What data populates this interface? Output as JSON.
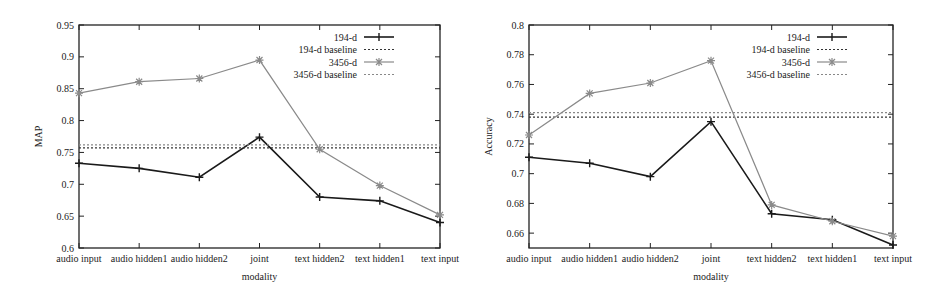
{
  "chart_data": [
    {
      "type": "line",
      "title": "",
      "xlabel": "modality",
      "ylabel": "MAP",
      "categories": [
        "audio input",
        "audio hidden1",
        "audio hidden2",
        "joint",
        "text hidden2",
        "text hidden1",
        "text input"
      ],
      "ylim": [
        0.6,
        0.95
      ],
      "yticks": [
        "0.6",
        "0.65",
        "0.7",
        "0.75",
        "0.8",
        "0.85",
        "0.9",
        "0.95"
      ],
      "grid": false,
      "legend_position": "top-right",
      "series": [
        {
          "name": "194-d",
          "style": "solid-plus",
          "color": "#1a1a1a",
          "values": [
            0.733,
            0.725,
            0.711,
            0.774,
            0.68,
            0.674,
            0.64
          ]
        },
        {
          "name": "194-d baseline",
          "style": "dotted",
          "color": "#333333",
          "values": [
            0.757,
            0.757,
            0.757,
            0.757,
            0.757,
            0.757,
            0.757
          ]
        },
        {
          "name": "3456-d",
          "style": "solid-star",
          "color": "#8a8a8a",
          "values": [
            0.843,
            0.861,
            0.866,
            0.895,
            0.755,
            0.698,
            0.652
          ]
        },
        {
          "name": "3456-d baseline",
          "style": "dotted",
          "color": "#888888",
          "values": [
            0.762,
            0.762,
            0.762,
            0.762,
            0.762,
            0.762,
            0.762
          ]
        }
      ]
    },
    {
      "type": "line",
      "title": "",
      "xlabel": "modality",
      "ylabel": "Accuracy",
      "categories": [
        "audio input",
        "audio hidden1",
        "audio hidden2",
        "joint",
        "text hidden2",
        "text hidden1",
        "text input"
      ],
      "ylim": [
        0.65,
        0.8
      ],
      "yticks": [
        "0.66",
        "0.68",
        "0.7",
        "0.72",
        "0.74",
        "0.76",
        "0.78",
        "0.8"
      ],
      "grid": false,
      "legend_position": "top-right",
      "series": [
        {
          "name": "194-d",
          "style": "solid-plus",
          "color": "#1a1a1a",
          "values": [
            0.711,
            0.707,
            0.698,
            0.735,
            0.673,
            0.669,
            0.652
          ]
        },
        {
          "name": "194-d baseline",
          "style": "dotted",
          "color": "#333333",
          "values": [
            0.738,
            0.738,
            0.738,
            0.738,
            0.738,
            0.738,
            0.738
          ]
        },
        {
          "name": "3456-d",
          "style": "solid-star",
          "color": "#8a8a8a",
          "values": [
            0.726,
            0.754,
            0.761,
            0.776,
            0.679,
            0.668,
            0.658
          ]
        },
        {
          "name": "3456-d baseline",
          "style": "dotted",
          "color": "#888888",
          "values": [
            0.741,
            0.741,
            0.741,
            0.741,
            0.741,
            0.741,
            0.741
          ]
        }
      ]
    }
  ]
}
